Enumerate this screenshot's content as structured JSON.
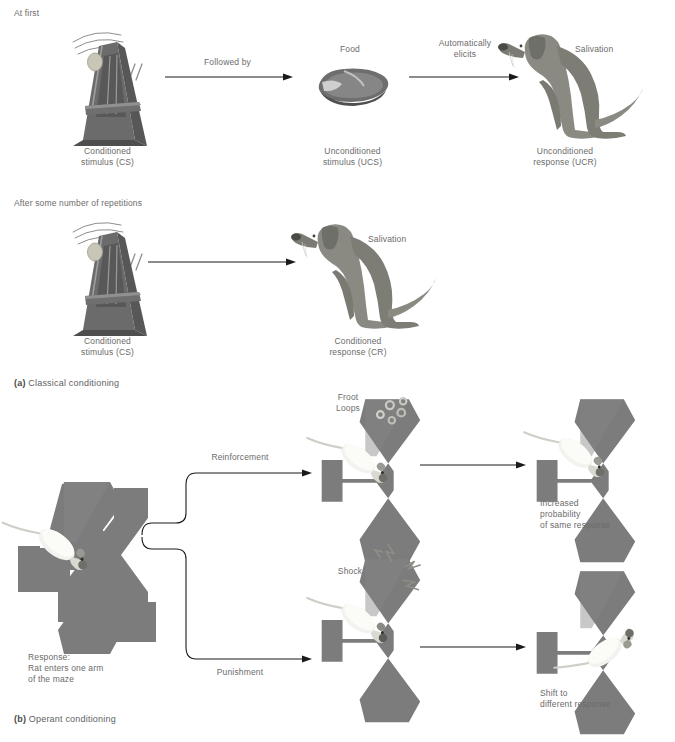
{
  "figure": {
    "panels": [
      {
        "id": "a",
        "marker": "(a)",
        "caption": "Classical conditioning",
        "rows": [
          {
            "heading": "At first",
            "items": [
              {
                "name": "metronome",
                "top_label": "",
                "bottom_label": "Conditioned\nstimulus (CS)"
              },
              {
                "name": "arrow",
                "label": "Followed by"
              },
              {
                "name": "food",
                "top_label": "Food",
                "bottom_label": "Unconditioned\nstimulus (UCS)"
              },
              {
                "name": "arrow",
                "label": "Automatically\nelicits"
              },
              {
                "name": "dog",
                "top_label": "Salivation",
                "bottom_label": "Unconditioned\nresponse (UCR)"
              }
            ]
          },
          {
            "heading": "After some number of repetitions",
            "items": [
              {
                "name": "metronome",
                "top_label": "",
                "bottom_label": "Conditioned\nstimulus (CS)"
              },
              {
                "name": "arrow",
                "label": ""
              },
              {
                "name": "dog",
                "top_label": "Salivation",
                "bottom_label": "Conditioned\nresponse (CR)"
              }
            ]
          }
        ]
      },
      {
        "id": "b",
        "marker": "(b)",
        "caption": "Operant conditioning",
        "start": {
          "label": "Response:\nRat enters one arm\nof the maze"
        },
        "branches": [
          {
            "arrow_label": "Reinforcement",
            "middle": {
              "stimulus_label": "Froot\nLoops"
            },
            "outcome": {
              "label": "Increased\nprobability\nof same response"
            }
          },
          {
            "arrow_label": "Punishment",
            "middle": {
              "stimulus_label": "Shock"
            },
            "outcome": {
              "label": "Shift to\ndifferent response"
            }
          }
        ]
      }
    ]
  },
  "colors": {
    "maze_gray": "#7c7c7c",
    "maze_gray_light": "#8d8d8d",
    "dog_gray": "#8a8a83",
    "metronome_gray": "#6e6e6e",
    "text_gray": "#6b6b6b",
    "line": "#1a1a1a"
  }
}
